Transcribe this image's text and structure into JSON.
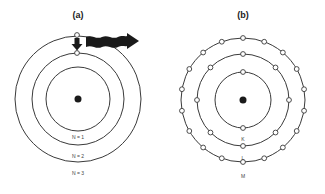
{
  "panel_a": {
    "label": "(a)",
    "center": [
      78,
      99
    ],
    "orbits": [
      {
        "name": "N = 1",
        "radius": 32
      },
      {
        "name": "N = 2",
        "radius": 46
      },
      {
        "name": "N = 3",
        "radius": 63
      }
    ],
    "shell_labels": [
      "N = 1",
      "N = 2",
      "N = 3"
    ],
    "transition": {
      "from": "N = 3",
      "to": "N = 2",
      "arrow": "down-arrow",
      "emission": "wavy-photon-arrow"
    }
  },
  "panel_b": {
    "label": "(b)",
    "center": [
      243,
      100
    ],
    "shells": [
      {
        "name": "K",
        "radius": 28,
        "electrons": 2
      },
      {
        "name": "L",
        "radius": 46,
        "electrons": 8
      },
      {
        "name": "M",
        "radius": 62,
        "electrons": 18
      }
    ],
    "shell_labels": [
      "K",
      "L",
      "M"
    ]
  },
  "colors": {
    "line": "#3a3a3a",
    "nucleus": "#1a1a1a",
    "arrow": "#1a1a1a"
  }
}
